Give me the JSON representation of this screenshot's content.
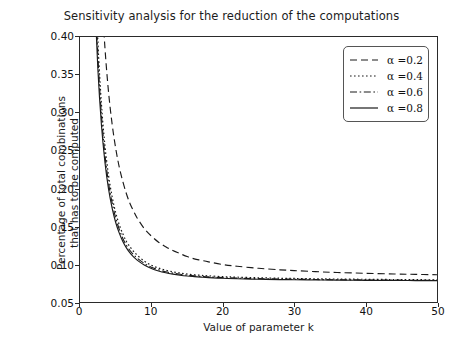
{
  "chart_data": {
    "type": "line",
    "title": "Sensitivity analysis for the reduction of the computations",
    "xlabel": "Value of parameter k",
    "ylabel_line1": "Percentage of total combinations",
    "ylabel_line2": "that has to be computed",
    "xlim": [
      0,
      50
    ],
    "ylim": [
      0.05,
      0.4
    ],
    "xticks": [
      0,
      10,
      20,
      30,
      40,
      50
    ],
    "xticklabels": [
      "0",
      "10",
      "20",
      "30",
      "40",
      "50"
    ],
    "yticks": [
      0.05,
      0.1,
      0.15,
      0.2,
      0.25,
      0.3,
      0.35,
      0.4
    ],
    "yticklabels": [
      "0.05",
      "0.10",
      "0.15",
      "0.20",
      "0.25",
      "0.30",
      "0.35",
      "0.40"
    ],
    "grid": false,
    "legend_position": "upper right",
    "line_color": "#1a1a1a",
    "x": [
      2,
      2.5,
      3,
      3.5,
      4,
      4.5,
      5,
      5.5,
      6,
      6.5,
      7,
      7.5,
      8,
      9,
      10,
      11,
      12,
      13,
      14,
      15,
      16,
      17,
      18,
      20,
      22,
      25,
      28,
      30,
      33,
      36,
      40,
      44,
      47,
      50
    ],
    "series": [
      {
        "name": "α =0.2",
        "alpha": 0.2,
        "linestyle": "dashed",
        "values": [
          0.74,
          0.58,
          0.465,
          0.385,
          0.327,
          0.285,
          0.253,
          0.228,
          0.209,
          0.193,
          0.18,
          0.17,
          0.161,
          0.147,
          0.137,
          0.129,
          0.123,
          0.118,
          0.114,
          0.11,
          0.107,
          0.105,
          0.103,
          0.0995,
          0.0972,
          0.0945,
          0.0925,
          0.0915,
          0.0901,
          0.089,
          0.0879,
          0.087,
          0.0865,
          0.086
        ]
      },
      {
        "name": "α =0.4",
        "alpha": 0.4,
        "linestyle": "dotted",
        "values": [
          0.52,
          0.395,
          0.312,
          0.256,
          0.217,
          0.189,
          0.168,
          0.152,
          0.14,
          0.13,
          0.123,
          0.117,
          0.112,
          0.104,
          0.0985,
          0.0948,
          0.092,
          0.0899,
          0.0883,
          0.087,
          0.086,
          0.0852,
          0.0845,
          0.0835,
          0.0828,
          0.082,
          0.0814,
          0.0811,
          0.0807,
          0.0803,
          0.08,
          0.0797,
          0.0795,
          0.0793
        ]
      },
      {
        "name": "α =0.6",
        "alpha": 0.6,
        "linestyle": "dashdot",
        "values": [
          0.495,
          0.376,
          0.297,
          0.244,
          0.207,
          0.181,
          0.161,
          0.146,
          0.134,
          0.125,
          0.118,
          0.1125,
          0.108,
          0.101,
          0.096,
          0.0926,
          0.09,
          0.0881,
          0.0866,
          0.0854,
          0.0845,
          0.0838,
          0.0831,
          0.0822,
          0.0815,
          0.0808,
          0.0803,
          0.08,
          0.0797,
          0.0794,
          0.0791,
          0.0789,
          0.0787,
          0.0786
        ]
      },
      {
        "name": "α =0.8",
        "alpha": 0.8,
        "linestyle": "solid",
        "values": [
          0.47,
          0.358,
          0.284,
          0.234,
          0.199,
          0.174,
          0.155,
          0.141,
          0.13,
          0.1215,
          0.1148,
          0.1095,
          0.1053,
          0.0988,
          0.0942,
          0.091,
          0.0886,
          0.0868,
          0.0854,
          0.0843,
          0.0835,
          0.0828,
          0.0822,
          0.0813,
          0.0807,
          0.0801,
          0.0796,
          0.0794,
          0.0791,
          0.0789,
          0.0786,
          0.0784,
          0.0783,
          0.0782
        ]
      }
    ]
  },
  "legend": {
    "items": [
      {
        "label": "α =0.2",
        "style": "dashed"
      },
      {
        "label": "α =0.4",
        "style": "dotted"
      },
      {
        "label": "α =0.6",
        "style": "dashdot"
      },
      {
        "label": "α =0.8",
        "style": "solid"
      }
    ]
  }
}
